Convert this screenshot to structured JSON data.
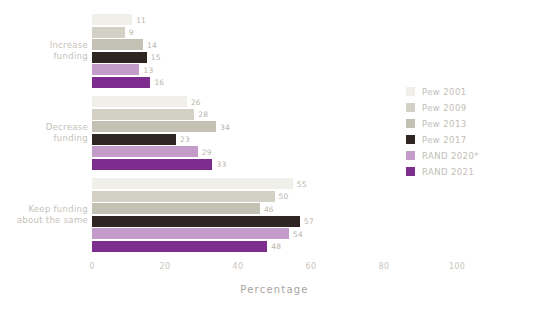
{
  "chart_data": {
    "type": "bar",
    "orientation": "horizontal",
    "title": "",
    "xlabel": "Percentage",
    "ylabel": "",
    "xlim": [
      0,
      100
    ],
    "xticks": [
      0,
      20,
      40,
      60,
      80,
      100
    ],
    "grid": false,
    "legend_position": "right",
    "categories": [
      "Increase funding",
      "Decrease funding",
      "Keep funding about the same"
    ],
    "category_lines": [
      [
        "Increase",
        "funding"
      ],
      [
        "Decrease",
        "funding"
      ],
      [
        "Keep funding",
        "about the same"
      ]
    ],
    "series": [
      {
        "name": "Pew 2001",
        "color": "#f1efea",
        "values": [
          11,
          26,
          55
        ]
      },
      {
        "name": "Pew 2009",
        "color": "#d3d0c6",
        "values": [
          9,
          28,
          50
        ]
      },
      {
        "name": "Pew 2013",
        "color": "#c3c0b4",
        "values": [
          14,
          34,
          46
        ]
      },
      {
        "name": "Pew 2017",
        "color": "#2f2621",
        "values": [
          15,
          23,
          57
        ]
      },
      {
        "name": "RAND 2020*",
        "color": "#c49cc9",
        "values": [
          13,
          29,
          54
        ]
      },
      {
        "name": "RAND 2021",
        "color": "#7c2d8d",
        "values": [
          16,
          33,
          48
        ]
      }
    ]
  },
  "axis": {
    "x_title": "Percentage",
    "x_tick_labels": [
      "0",
      "20",
      "40",
      "60",
      "80",
      "100"
    ]
  },
  "legend": {
    "items": [
      {
        "label": "Pew 2001"
      },
      {
        "label": "Pew 2009"
      },
      {
        "label": "Pew 2013"
      },
      {
        "label": "Pew 2017"
      },
      {
        "label": "RAND 2020*"
      },
      {
        "label": "RAND 2021"
      }
    ]
  }
}
